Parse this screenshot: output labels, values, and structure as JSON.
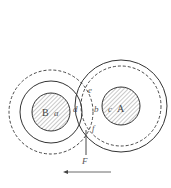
{
  "diagram": {
    "type": "two rotating cylinders with boundary layers (circles and rings)",
    "colors": {
      "stroke": "#333333",
      "hatch": "#666666",
      "label": "#555555",
      "background": "#ffffff"
    },
    "cylinders": [
      {
        "name": "B",
        "label": "B",
        "surface_point_label": "a",
        "center": [
          51,
          112
        ],
        "core_radius": 19,
        "solid_ring_radius": 31,
        "dashed_ring_radius": 42
      },
      {
        "name": "A",
        "label": "A",
        "surface_point_label": "c",
        "center": [
          121,
          106
        ],
        "core_radius": 19,
        "solid_ring_radius": 46,
        "dashed_ring_radius": 40
      }
    ],
    "point_labels": {
      "d": "d",
      "e": "e",
      "b": "b",
      "f": "f"
    },
    "force": {
      "label": "F",
      "line": {
        "x": 86,
        "y1": 130,
        "y2": 155
      }
    },
    "arrow": {
      "direction": "left",
      "from": [
        111,
        172
      ],
      "to": [
        63,
        172
      ]
    }
  }
}
